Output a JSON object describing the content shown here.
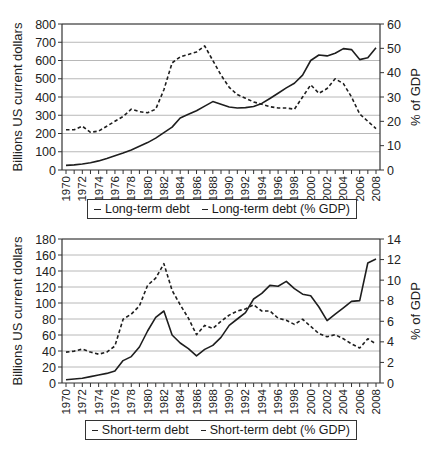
{
  "chart_data": [
    {
      "type": "line",
      "title": "",
      "xlabel": "",
      "ylabel": "Billions US current dollars",
      "y2label": "% of GDP",
      "ylim": [
        0,
        800
      ],
      "y2lim": [
        0,
        60
      ],
      "yticks": [
        0,
        100,
        200,
        300,
        400,
        500,
        600,
        700,
        800
      ],
      "y2ticks": [
        0,
        10,
        20,
        30,
        40,
        50,
        60
      ],
      "grid": true,
      "legend_position": "bottom",
      "x": [
        1970,
        1971,
        1972,
        1973,
        1974,
        1975,
        1976,
        1977,
        1978,
        1979,
        1980,
        1981,
        1982,
        1983,
        1984,
        1985,
        1986,
        1987,
        1988,
        1989,
        1990,
        1991,
        1992,
        1993,
        1994,
        1995,
        1996,
        1997,
        1998,
        1999,
        2000,
        2001,
        2002,
        2003,
        2004,
        2005,
        2006,
        2007,
        2008
      ],
      "xtick_labels": [
        "1970",
        "1972",
        "1974",
        "1976",
        "1978",
        "1980",
        "1982",
        "1984",
        "1986",
        "1988",
        "1990",
        "1992",
        "1994",
        "1996",
        "1998",
        "2000",
        "2002",
        "2004",
        "2006",
        "2008"
      ],
      "series": [
        {
          "name": "Long-term debt",
          "axis": "left",
          "style": "solid",
          "values": [
            25,
            28,
            33,
            40,
            50,
            63,
            78,
            93,
            110,
            130,
            150,
            175,
            205,
            235,
            285,
            305,
            325,
            350,
            375,
            360,
            345,
            340,
            342,
            348,
            365,
            392,
            420,
            450,
            475,
            520,
            600,
            630,
            625,
            640,
            665,
            660,
            605,
            615,
            670,
            720
          ]
        },
        {
          "name": "Long-term debt (% GDP)",
          "axis": "right",
          "style": "dashed",
          "values": [
            16.5,
            16.5,
            18,
            15.5,
            16,
            18,
            20,
            22,
            25,
            24,
            23.5,
            25,
            33,
            44,
            46.5,
            47.5,
            48.5,
            51,
            45,
            39,
            34,
            31,
            29.5,
            28,
            27,
            26,
            25.5,
            25.5,
            25,
            30,
            35,
            31.5,
            33.5,
            37.5,
            35.5,
            30,
            23,
            20,
            17
          ]
        }
      ]
    },
    {
      "type": "line",
      "title": "",
      "xlabel": "",
      "ylabel": "Billions US current dollars",
      "y2label": "% of GDP",
      "ylim": [
        0,
        180
      ],
      "y2lim": [
        0,
        14
      ],
      "yticks": [
        0,
        20,
        40,
        60,
        80,
        100,
        120,
        140,
        160,
        180
      ],
      "y2ticks": [
        0,
        2,
        4,
        6,
        8,
        10,
        12,
        14
      ],
      "grid": true,
      "legend_position": "bottom",
      "x": [
        1970,
        1971,
        1972,
        1973,
        1974,
        1975,
        1976,
        1977,
        1978,
        1979,
        1980,
        1981,
        1982,
        1983,
        1984,
        1985,
        1986,
        1987,
        1988,
        1989,
        1990,
        1991,
        1992,
        1993,
        1994,
        1995,
        1996,
        1997,
        1998,
        1999,
        2000,
        2001,
        2002,
        2003,
        2004,
        2005,
        2006,
        2007,
        2008
      ],
      "xtick_labels": [
        "1970",
        "1972",
        "1974",
        "1976",
        "1978",
        "1980",
        "1982",
        "1984",
        "1986",
        "1988",
        "1990",
        "1992",
        "1994",
        "1996",
        "1998",
        "2000",
        "2002",
        "2004",
        "2006",
        "2008"
      ],
      "series": [
        {
          "name": "Short-term debt",
          "axis": "left",
          "style": "solid",
          "values": [
            4,
            5,
            6,
            8,
            10,
            12,
            15,
            28,
            33,
            45,
            65,
            82,
            90,
            60,
            50,
            43,
            34,
            42,
            47,
            57,
            72,
            80,
            88,
            105,
            112,
            122,
            121,
            127,
            118,
            111,
            109,
            95,
            78,
            86,
            94,
            102,
            103,
            150,
            155
          ]
        },
        {
          "name": "Short-term debt (% GDP)",
          "axis": "right",
          "style": "dashed",
          "values": [
            3.0,
            3.1,
            3.3,
            3.0,
            2.8,
            3.0,
            3.6,
            6.2,
            6.7,
            7.5,
            9.5,
            10.2,
            11.6,
            9.0,
            7.6,
            6.3,
            4.7,
            5.6,
            5.3,
            6.0,
            6.6,
            7.0,
            7.2,
            7.6,
            7.0,
            7.0,
            6.3,
            6.1,
            5.7,
            6.2,
            5.5,
            4.8,
            4.5,
            4.7,
            4.3,
            3.8,
            3.4,
            4.3,
            3.8
          ]
        }
      ]
    }
  ],
  "charts": [
    {
      "ylabel": "Billions US current dollars",
      "y2label": "% of GDP",
      "legend": {
        "solid_label": "Long-term debt",
        "dashed_label": "Long-term debt (% GDP)"
      }
    },
    {
      "ylabel": "Billions US current dollars",
      "y2label": "% of GDP",
      "legend": {
        "solid_label": "Short-term debt",
        "dashed_label": "Short-term debt (% GDP)"
      }
    }
  ]
}
